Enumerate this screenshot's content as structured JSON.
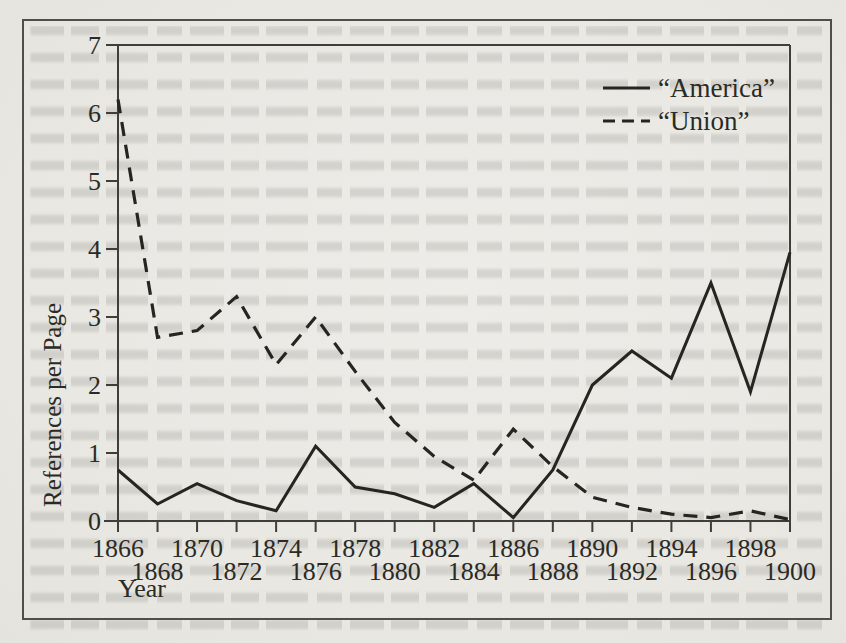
{
  "figure": {
    "ink_color": "#262520",
    "axis_color": "#403e38",
    "paper_color": "#e9e8e3"
  },
  "chart_data": {
    "type": "line",
    "title": "",
    "xlabel": "Year",
    "ylabel": "References per Page",
    "xlim": [
      1866,
      1900
    ],
    "ylim": [
      0,
      7
    ],
    "grid": false,
    "legend_position": "upper-right",
    "x_ticks": [
      1866,
      1868,
      1870,
      1872,
      1874,
      1876,
      1878,
      1880,
      1882,
      1884,
      1886,
      1888,
      1890,
      1892,
      1894,
      1896,
      1898,
      1900
    ],
    "y_ticks": [
      0,
      1,
      2,
      3,
      4,
      5,
      6,
      7
    ],
    "x": [
      1866,
      1868,
      1870,
      1872,
      1874,
      1876,
      1878,
      1880,
      1882,
      1884,
      1886,
      1888,
      1890,
      1892,
      1894,
      1896,
      1898,
      1900
    ],
    "series": [
      {
        "name": "“America”",
        "line_style": "solid",
        "values": [
          0.75,
          0.25,
          0.55,
          0.3,
          0.15,
          1.1,
          0.5,
          0.4,
          0.2,
          0.55,
          0.05,
          0.75,
          2.0,
          2.5,
          2.1,
          3.5,
          1.9,
          3.95
        ]
      },
      {
        "name": "“Union”",
        "line_style": "dashed",
        "values": [
          6.2,
          2.7,
          2.8,
          3.3,
          2.3,
          3.0,
          2.2,
          1.45,
          0.95,
          0.6,
          1.35,
          0.8,
          0.35,
          0.2,
          0.1,
          0.05,
          0.15,
          0.02
        ]
      }
    ]
  }
}
